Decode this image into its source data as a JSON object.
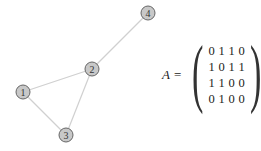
{
  "graph": {
    "nodes": [
      {
        "id": "1",
        "label": "1",
        "x": 23,
        "y": 92
      },
      {
        "id": "2",
        "label": "2",
        "x": 92,
        "y": 69
      },
      {
        "id": "3",
        "label": "3",
        "x": 66,
        "y": 135
      },
      {
        "id": "4",
        "label": "4",
        "x": 148,
        "y": 13
      }
    ],
    "edges": [
      [
        "1",
        "2"
      ],
      [
        "1",
        "3"
      ],
      [
        "2",
        "3"
      ],
      [
        "2",
        "4"
      ]
    ],
    "node_fill": "#c8c8c8",
    "node_stroke": "#666666",
    "edge_color": "#d0d0d0"
  },
  "matrix": {
    "name": "A",
    "equals": "=",
    "rows": [
      [
        "0",
        "1",
        "1",
        "0"
      ],
      [
        "1",
        "0",
        "1",
        "1"
      ],
      [
        "1",
        "1",
        "0",
        "0"
      ],
      [
        "0",
        "1",
        "0",
        "0"
      ]
    ]
  }
}
